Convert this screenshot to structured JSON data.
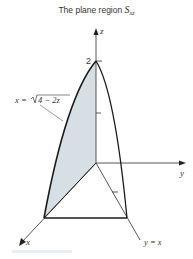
{
  "title": {
    "prefix": "The plane region ",
    "symbol": "S",
    "subscript": "xz"
  },
  "axes": {
    "z_label": "z",
    "y_label": "y",
    "x_label": "x",
    "z_tick_label": "2"
  },
  "annotations": {
    "curve_equation_lhs": "x = ",
    "curve_equation_radicand": "4 − 2z",
    "diagonal_line_label": "y = x"
  },
  "colors": {
    "shading": "#d6dfe3",
    "stroke": "#1a1a1a",
    "axis": "#444444"
  }
}
